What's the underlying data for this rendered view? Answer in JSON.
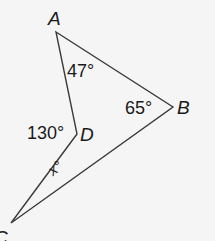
{
  "figure": {
    "type": "quadrilateral-concave",
    "stroke_color": "#3a3a3a",
    "background": "#f5f5f5",
    "vertices": [
      {
        "name": "A",
        "label": "A",
        "x": 56,
        "y": 32
      },
      {
        "name": "B",
        "label": "B",
        "x": 173,
        "y": 107
      },
      {
        "name": "C",
        "label": "C",
        "x": 11,
        "y": 223
      },
      {
        "name": "D",
        "label": "D",
        "x": 77,
        "y": 134
      }
    ],
    "segments": [
      [
        "A",
        "B"
      ],
      [
        "B",
        "C"
      ],
      [
        "C",
        "D"
      ],
      [
        "D",
        "A"
      ]
    ],
    "angles": [
      {
        "at": "A",
        "label": "47°"
      },
      {
        "at": "B",
        "label": "65°"
      },
      {
        "at": "D",
        "label": "130°"
      },
      {
        "at": "C",
        "label": "x°"
      }
    ]
  }
}
